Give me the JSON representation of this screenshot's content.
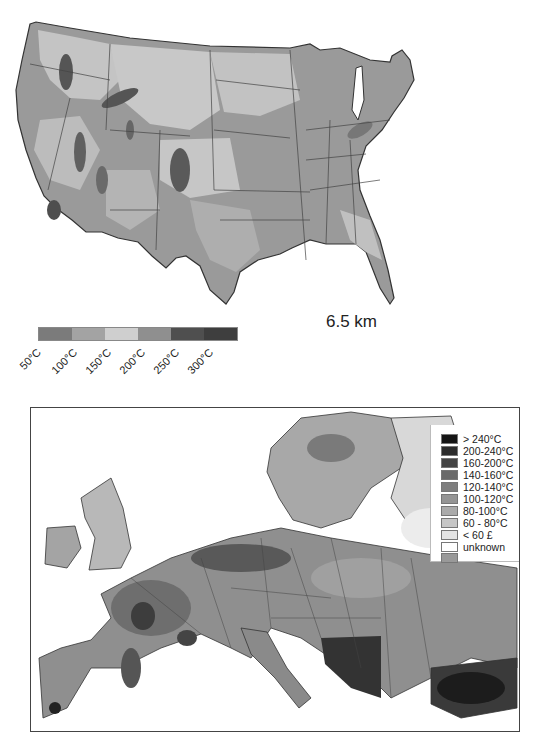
{
  "figure_top": {
    "title": "6.5 km",
    "region": "United States",
    "colorbar": {
      "swatches": [
        "#7b7b7b",
        "#a3a3a3",
        "#cfcfcf",
        "#8f8f8f",
        "#4f4f4f",
        "#3e3e3e"
      ],
      "labels": [
        "50°C",
        "100°C",
        "150°C",
        "200°C",
        "250°C",
        "300°C"
      ]
    }
  },
  "figure_bottom": {
    "region": "Europe",
    "legend": {
      "items": [
        {
          "label": "> 240°C",
          "color": "#151515"
        },
        {
          "label": "200-240°C",
          "color": "#2c2c2c"
        },
        {
          "label": "160-200°C",
          "color": "#444444"
        },
        {
          "label": "140-160°C",
          "color": "#6a6a6a"
        },
        {
          "label": "120-140°C",
          "color": "#7e7e7e"
        },
        {
          "label": "100-120°C",
          "color": "#959595"
        },
        {
          "label": "80-100°C",
          "color": "#ababab"
        },
        {
          "label": "60 - 80°C",
          "color": "#c6c6c6"
        },
        {
          "label": "< 60 £",
          "color": "#e4e4e4"
        },
        {
          "label": "unknown",
          "color": "#ffffff"
        },
        {
          "label": "",
          "color": "#999999"
        }
      ]
    }
  }
}
